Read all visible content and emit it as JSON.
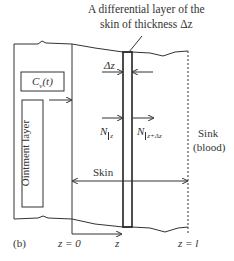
{
  "figure": {
    "panel_label": "(b)",
    "title_line1": "A differential layer of the",
    "title_line2": "skin of thickness Δz",
    "concentration_label": "C",
    "concentration_sub": "v",
    "concentration_arg": "(t)",
    "ointment_label": "Ointment layer",
    "delta_z_label": "Δz",
    "flux_in_label": "N",
    "flux_in_sub": "z",
    "flux_out_label": "N",
    "flux_out_sub": "z+Δz",
    "sink_line1": "Sink",
    "sink_line2": "(blood)",
    "skin_label": "Skin",
    "z0_label": "z = 0",
    "z_axis_label": "z",
    "zl_label": "z = l"
  },
  "colors": {
    "line": "#333333",
    "background": "#ffffff"
  }
}
